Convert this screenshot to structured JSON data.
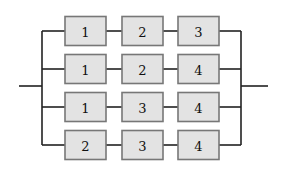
{
  "diagram": {
    "type": "series-parallel reliability block diagram",
    "branches": [
      {
        "components": [
          "1",
          "2",
          "3"
        ]
      },
      {
        "components": [
          "1",
          "2",
          "4"
        ]
      },
      {
        "components": [
          "1",
          "3",
          "4"
        ]
      },
      {
        "components": [
          "2",
          "3",
          "4"
        ]
      }
    ],
    "colors": {
      "box_fill": "#e3e3e3",
      "box_border": "#777777",
      "wire": "#222222"
    }
  }
}
